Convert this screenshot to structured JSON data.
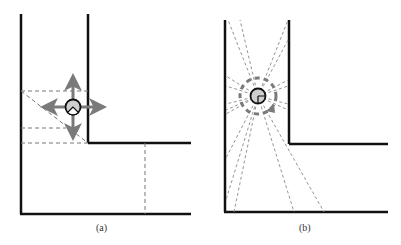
{
  "figure": {
    "panels": [
      {
        "id": "a",
        "caption": "(a)",
        "description": "Corridor corner with robot showing four-direction motion arrows and dashed region decomposition"
      },
      {
        "id": "b",
        "caption": "(b)",
        "description": "Corridor corner with robot emitting dashed sensor rays and a rotation ring"
      }
    ],
    "colors": {
      "wall": "#111111",
      "dashed": "#777777",
      "arrow": "#7a7a7a",
      "robot_fill": "#cfcfcf",
      "robot_outline": "#111111"
    }
  }
}
